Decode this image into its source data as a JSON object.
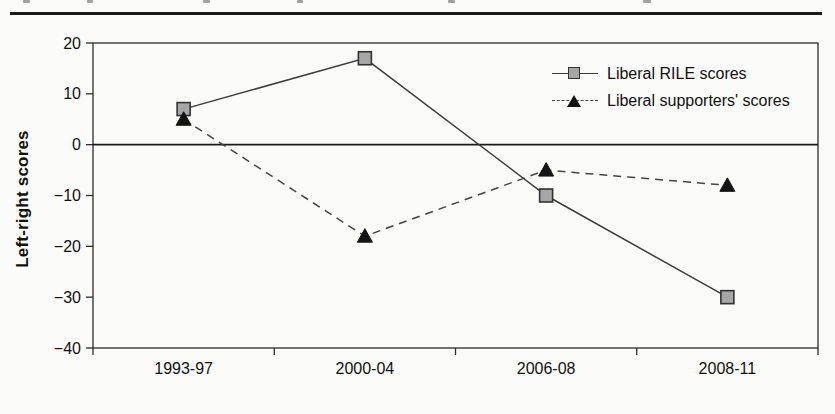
{
  "page": {
    "background": "#fbfbf9"
  },
  "top_rule": {
    "color": "#1a1a1a"
  },
  "chart_data": {
    "type": "line",
    "title": "",
    "categories": [
      "1993-97",
      "2000-04",
      "2006-08",
      "2008-11"
    ],
    "series": [
      {
        "name": "Liberal RILE scores",
        "values": [
          7,
          17,
          -10,
          -30
        ],
        "line_style": "solid",
        "marker": "square",
        "line_color": "#3d3d3d",
        "marker_fill": "#a6a6a6",
        "marker_stroke": "#333333"
      },
      {
        "name": "Liberal supporters' scores",
        "values": [
          5,
          -18,
          -5,
          -8
        ],
        "line_style": "dashed",
        "marker": "triangle",
        "line_color": "#444444",
        "marker_fill": "#141414",
        "marker_stroke": "#141414"
      }
    ],
    "xlabel": "",
    "ylabel": "Left-right scores",
    "ylim": [
      -40,
      20
    ],
    "ytick_step": 10,
    "yticks": [
      "20",
      "10",
      "0",
      "−10",
      "−20",
      "−30",
      "−40"
    ],
    "zero_line": true,
    "grid": false,
    "plot_border": true,
    "legend_position": "upper-right-inside",
    "axis_color": "#2b2b2b",
    "text_color": "#111111"
  }
}
